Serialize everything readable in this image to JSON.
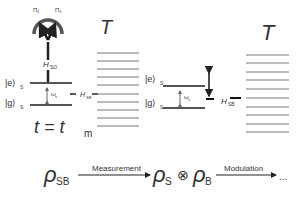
{
  "left_panel": {
    "meter_labels": [
      "Π₁",
      "Π₀"
    ],
    "h_so": "H",
    "h_so_sub": "SO",
    "excited_state": "|e⟩",
    "excited_sub": "S",
    "ground_state": "|g⟩",
    "ground_sub": "S",
    "omega": "ω",
    "omega_sub": "s",
    "h_sb": "H",
    "h_sb_sub": "SB",
    "bath_label": "T",
    "time_lhs": "t = t",
    "time_sub": "m"
  },
  "right_panel": {
    "excited_state": "|e⟩",
    "excited_sub": "S",
    "ground_state": "|g⟩",
    "ground_sub": "S",
    "omega": "ω",
    "omega_sub": "s",
    "h_sb": "H",
    "h_sb_sub": "SB",
    "bath_label": "T"
  },
  "process": {
    "rho": "ρ",
    "sb_sub": "SB",
    "arrow1_label": "Measurement",
    "s_sub": "S",
    "tensor": "⊗",
    "b_sub": "B",
    "arrow2_label": "Modulation",
    "ellipsis": "..."
  },
  "colors": {
    "line": "#222222",
    "level": "#555555",
    "bath": "#666666"
  }
}
